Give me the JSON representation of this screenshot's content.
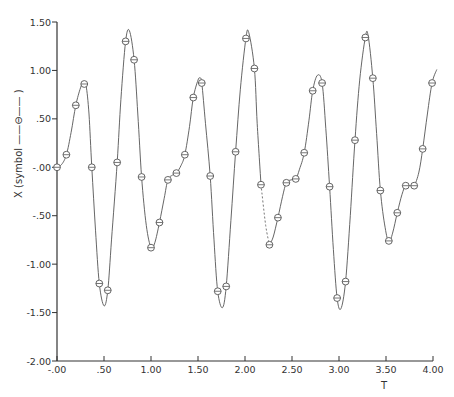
{
  "chart_data": {
    "type": "line",
    "title": "",
    "xlabel": "T",
    "ylabel": "X  (symbol ——⊖—— )",
    "xlim": [
      0.0,
      4.0
    ],
    "ylim": [
      -2.0,
      1.5
    ],
    "grid": false,
    "legend": "none (symbol described in y-axis label)",
    "x_ticks": [
      "-.00",
      ".50",
      "1.00",
      "1.50",
      "2.00",
      "2.50",
      "3.00",
      "3.50",
      "4.00"
    ],
    "y_ticks": [
      "-2.00",
      "-1.50",
      "-1.00",
      "-.50",
      "-.00",
      ".50",
      "1.00",
      "1.50"
    ],
    "series": [
      {
        "name": "X",
        "marker": "circle-with-bar",
        "curve": [
          [
            0.0,
            0.0
          ],
          [
            0.05,
            0.03
          ],
          [
            0.1,
            0.13
          ],
          [
            0.15,
            0.36
          ],
          [
            0.2,
            0.64
          ],
          [
            0.25,
            0.82
          ],
          [
            0.28,
            0.88
          ],
          [
            0.31,
            0.84
          ],
          [
            0.34,
            0.55
          ],
          [
            0.37,
            0.0
          ],
          [
            0.41,
            -0.65
          ],
          [
            0.45,
            -1.2
          ],
          [
            0.5,
            -1.43
          ],
          [
            0.54,
            -1.27
          ],
          [
            0.58,
            -0.75
          ],
          [
            0.64,
            0.05
          ],
          [
            0.68,
            0.7
          ],
          [
            0.73,
            1.3
          ],
          [
            0.77,
            1.41
          ],
          [
            0.82,
            1.11
          ],
          [
            0.86,
            0.55
          ],
          [
            0.9,
            -0.1
          ],
          [
            0.95,
            -0.6
          ],
          [
            1.0,
            -0.83
          ],
          [
            1.04,
            -0.78
          ],
          [
            1.09,
            -0.57
          ],
          [
            1.14,
            -0.32
          ],
          [
            1.18,
            -0.13
          ],
          [
            1.23,
            -0.08
          ],
          [
            1.27,
            -0.06
          ],
          [
            1.32,
            0.02
          ],
          [
            1.36,
            0.13
          ],
          [
            1.41,
            0.42
          ],
          [
            1.45,
            0.72
          ],
          [
            1.5,
            0.9
          ],
          [
            1.52,
            0.92
          ],
          [
            1.54,
            0.87
          ],
          [
            1.58,
            0.45
          ],
          [
            1.63,
            -0.09
          ],
          [
            1.67,
            -0.75
          ],
          [
            1.71,
            -1.28
          ],
          [
            1.76,
            -1.45
          ],
          [
            1.8,
            -1.23
          ],
          [
            1.85,
            -0.55
          ],
          [
            1.9,
            0.16
          ],
          [
            1.95,
            0.8
          ],
          [
            2.01,
            1.33
          ],
          [
            2.04,
            1.39
          ],
          [
            2.1,
            1.02
          ],
          [
            2.13,
            0.45
          ],
          [
            2.17,
            -0.18
          ],
          [
            2.22,
            -0.6
          ],
          [
            2.26,
            -0.8
          ],
          [
            2.3,
            -0.72
          ],
          [
            2.35,
            -0.52
          ],
          [
            2.4,
            -0.3
          ],
          [
            2.44,
            -0.16
          ],
          [
            2.49,
            -0.13
          ],
          [
            2.54,
            -0.12
          ],
          [
            2.58,
            -0.02
          ],
          [
            2.63,
            0.15
          ],
          [
            2.68,
            0.48
          ],
          [
            2.72,
            0.79
          ],
          [
            2.77,
            0.95
          ],
          [
            2.82,
            0.87
          ],
          [
            2.86,
            0.4
          ],
          [
            2.9,
            -0.2
          ],
          [
            2.94,
            -0.85
          ],
          [
            2.98,
            -1.35
          ],
          [
            3.02,
            -1.46
          ],
          [
            3.07,
            -1.18
          ],
          [
            3.12,
            -0.5
          ],
          [
            3.17,
            0.28
          ],
          [
            3.22,
            0.9
          ],
          [
            3.28,
            1.34
          ],
          [
            3.31,
            1.36
          ],
          [
            3.36,
            0.92
          ],
          [
            3.4,
            0.35
          ],
          [
            3.44,
            -0.24
          ],
          [
            3.49,
            -0.62
          ],
          [
            3.53,
            -0.77
          ],
          [
            3.57,
            -0.68
          ],
          [
            3.62,
            -0.47
          ],
          [
            3.67,
            -0.28
          ],
          [
            3.71,
            -0.19
          ],
          [
            3.76,
            -0.19
          ],
          [
            3.8,
            -0.19
          ],
          [
            3.85,
            -0.05
          ],
          [
            3.89,
            0.19
          ],
          [
            3.94,
            0.55
          ],
          [
            3.99,
            0.87
          ],
          [
            4.04,
            1.01
          ]
        ],
        "markers": [
          [
            0.0,
            0.0
          ],
          [
            0.1,
            0.13
          ],
          [
            0.2,
            0.64
          ],
          [
            0.29,
            0.86
          ],
          [
            0.37,
            0.0
          ],
          [
            0.45,
            -1.2
          ],
          [
            0.54,
            -1.27
          ],
          [
            0.64,
            0.05
          ],
          [
            0.73,
            1.3
          ],
          [
            0.82,
            1.11
          ],
          [
            0.9,
            -0.1
          ],
          [
            1.0,
            -0.83
          ],
          [
            1.09,
            -0.57
          ],
          [
            1.18,
            -0.13
          ],
          [
            1.27,
            -0.06
          ],
          [
            1.36,
            0.13
          ],
          [
            1.45,
            0.72
          ],
          [
            1.54,
            0.87
          ],
          [
            1.63,
            -0.09
          ],
          [
            1.71,
            -1.28
          ],
          [
            1.8,
            -1.23
          ],
          [
            1.9,
            0.16
          ],
          [
            2.01,
            1.33
          ],
          [
            2.1,
            1.02
          ],
          [
            2.17,
            -0.18
          ],
          [
            2.26,
            -0.8
          ],
          [
            2.35,
            -0.52
          ],
          [
            2.44,
            -0.16
          ],
          [
            2.54,
            -0.12
          ],
          [
            2.63,
            0.15
          ],
          [
            2.72,
            0.79
          ],
          [
            2.82,
            0.87
          ],
          [
            2.9,
            -0.2
          ],
          [
            2.98,
            -1.35
          ],
          [
            3.07,
            -1.18
          ],
          [
            3.17,
            0.28
          ],
          [
            3.28,
            1.34
          ],
          [
            3.36,
            0.92
          ],
          [
            3.44,
            -0.24
          ],
          [
            3.53,
            -0.76
          ],
          [
            3.62,
            -0.47
          ],
          [
            3.71,
            -0.19
          ],
          [
            3.8,
            -0.19
          ],
          [
            3.89,
            0.19
          ],
          [
            3.99,
            0.87
          ]
        ],
        "dashed_segment": [
          2.17,
          2.26
        ]
      }
    ]
  },
  "colors": {
    "line": "#555555",
    "axis": "#333333",
    "text": "#333333",
    "background": "#ffffff"
  }
}
